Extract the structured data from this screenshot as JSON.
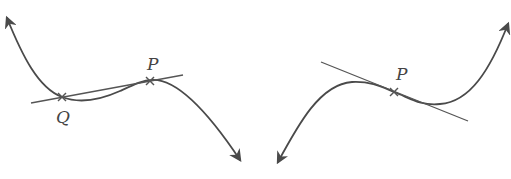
{
  "figure": {
    "left_panel": {
      "description": "Cubic-like curve with a secant line through points Q and P",
      "points": [
        {
          "label": "Q",
          "x": 62,
          "y": 97,
          "label_x": 56,
          "label_y": 123
        },
        {
          "label": "P",
          "x": 150,
          "y": 81,
          "label_x": 147,
          "label_y": 70
        }
      ],
      "line": {
        "type": "secant",
        "x1": 31,
        "y1": 103,
        "x2": 183,
        "y2": 75
      },
      "arrow_ends": [
        "upper-left",
        "lower-right"
      ]
    },
    "right_panel": {
      "description": "Cubic-like curve with a tangent line at inflection point P",
      "points": [
        {
          "label": "P",
          "x": 394,
          "y": 92,
          "label_x": 396,
          "label_y": 80
        }
      ],
      "line": {
        "type": "tangent",
        "x1": 321,
        "y1": 62,
        "x2": 468,
        "y2": 121
      },
      "arrow_ends": [
        "lower-left",
        "upper-right"
      ]
    },
    "colors": {
      "curve": "#4a4a4a",
      "line": "#555555",
      "label": "#444444",
      "background": "#ffffff"
    }
  }
}
